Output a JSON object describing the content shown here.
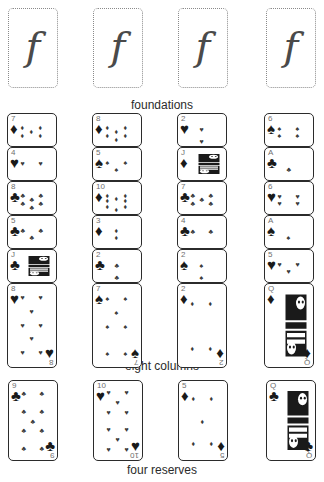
{
  "layout": {
    "width": 324,
    "height": 482,
    "background": "#ffffff",
    "card_ink": "#1a1a1a",
    "card_border": "#2b2b2b",
    "placeholder_border": "#8a8a8a",
    "rank_color": "#6f6f6f"
  },
  "sections": {
    "foundations_caption": "foundations",
    "columns_caption": "eight columns",
    "reserves_caption": "four reserves"
  },
  "foundations": {
    "glyph": "f",
    "slots": [
      {
        "label": "f",
        "name": "foundation-slot-1"
      },
      {
        "label": "f",
        "name": "foundation-slot-2"
      },
      {
        "label": "f",
        "name": "foundation-slot-3"
      },
      {
        "label": "f",
        "name": "foundation-slot-4"
      }
    ]
  },
  "columns": [
    {
      "index": 1,
      "cards": [
        {
          "rank": "7",
          "suit": "diamond",
          "glyph": "♦",
          "pips": 7,
          "face": false
        },
        {
          "rank": "4",
          "suit": "heart",
          "glyph": "♥",
          "pips": 4,
          "face": false
        },
        {
          "rank": "8",
          "suit": "club",
          "glyph": "♣",
          "pips": 8,
          "face": false
        },
        {
          "rank": "5",
          "suit": "club",
          "glyph": "♣",
          "pips": 5,
          "face": false
        },
        {
          "rank": "J",
          "suit": "club",
          "glyph": "♣",
          "pips": 0,
          "face": true
        },
        {
          "rank": "8",
          "suit": "heart",
          "glyph": "♥",
          "pips": 8,
          "face": false
        }
      ]
    },
    {
      "index": 2,
      "cards": [
        {
          "rank": "8",
          "suit": "diamond",
          "glyph": "♦",
          "pips": 8,
          "face": false
        },
        {
          "rank": "5",
          "suit": "spade",
          "glyph": "♠",
          "pips": 5,
          "face": false
        },
        {
          "rank": "10",
          "suit": "diamond",
          "glyph": "♦",
          "pips": 10,
          "face": false
        },
        {
          "rank": "3",
          "suit": "diamond",
          "glyph": "♦",
          "pips": 3,
          "face": false
        },
        {
          "rank": "2",
          "suit": "club",
          "glyph": "♣",
          "pips": 2,
          "face": false
        },
        {
          "rank": "7",
          "suit": "spade",
          "glyph": "♠",
          "pips": 7,
          "face": false
        }
      ]
    },
    {
      "index": 3,
      "cards": [
        {
          "rank": "2",
          "suit": "heart",
          "glyph": "♥",
          "pips": 2,
          "face": false
        },
        {
          "rank": "J",
          "suit": "diamond",
          "glyph": "♦",
          "pips": 0,
          "face": true
        },
        {
          "rank": "7",
          "suit": "club",
          "glyph": "♣",
          "pips": 7,
          "face": false
        },
        {
          "rank": "4",
          "suit": "club",
          "glyph": "♣",
          "pips": 4,
          "face": false
        },
        {
          "rank": "2",
          "suit": "spade",
          "glyph": "♠",
          "pips": 2,
          "face": false
        },
        {
          "rank": "2",
          "suit": "diamond",
          "glyph": "♦",
          "pips": 4,
          "face": false
        }
      ]
    },
    {
      "index": 4,
      "cards": [
        {
          "rank": "6",
          "suit": "spade",
          "glyph": "♠",
          "pips": 6,
          "face": false
        },
        {
          "rank": "A",
          "suit": "club",
          "glyph": "♣",
          "pips": 1,
          "face": false
        },
        {
          "rank": "6",
          "suit": "heart",
          "glyph": "♥",
          "pips": 6,
          "face": false
        },
        {
          "rank": "A",
          "suit": "spade",
          "glyph": "♠",
          "pips": 1,
          "face": false
        },
        {
          "rank": "5",
          "suit": "heart",
          "glyph": "♥",
          "pips": 5,
          "face": false
        },
        {
          "rank": "Q",
          "suit": "diamond",
          "glyph": "♦",
          "pips": 0,
          "face": true
        }
      ]
    }
  ],
  "reserves": [
    {
      "rank": "9",
      "suit": "club",
      "glyph": "♣",
      "pips": 9,
      "face": false
    },
    {
      "rank": "10",
      "suit": "heart",
      "glyph": "♥",
      "pips": 10,
      "face": false
    },
    {
      "rank": "5",
      "suit": "diamond",
      "glyph": "♦",
      "pips": 5,
      "face": false
    },
    {
      "rank": "Q",
      "suit": "club",
      "glyph": "♣",
      "pips": 0,
      "face": true
    }
  ]
}
